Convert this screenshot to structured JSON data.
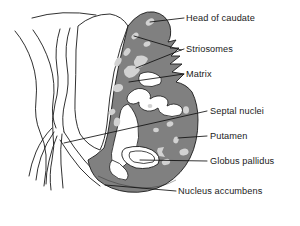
{
  "figure": {
    "kind": "anatomical-line-diagram",
    "canvas": {
      "width": 300,
      "height": 226
    },
    "colors": {
      "background": "#ffffff",
      "outline": "#1a1a1a",
      "striatum_fill": "#808080",
      "striosome_fill": "#d2d2d2",
      "white_matter": "#ffffff",
      "leader_line": "#111111",
      "label_text": "#1a1a1a"
    }
  },
  "labels": [
    {
      "id": "head-of-caudate",
      "text": "Head of caudate",
      "x": 186,
      "y": 14
    },
    {
      "id": "striosomes",
      "text": "Striosomes",
      "x": 186,
      "y": 45
    },
    {
      "id": "matrix",
      "text": "Matrix",
      "x": 186,
      "y": 70
    },
    {
      "id": "septal-nuclei",
      "text": "Septal nuclei",
      "x": 210,
      "y": 107
    },
    {
      "id": "putamen",
      "text": "Putamen",
      "x": 210,
      "y": 132
    },
    {
      "id": "globus-pallidus",
      "text": "Globus pallidus",
      "x": 210,
      "y": 158
    },
    {
      "id": "nucleus-accumbens",
      "text": "Nucleus accumbens",
      "x": 178,
      "y": 187
    }
  ],
  "structures": [
    {
      "id": "caudate-head",
      "name": "Head of caudate"
    },
    {
      "id": "striosomes",
      "name": "Striosomes"
    },
    {
      "id": "matrix",
      "name": "Matrix"
    },
    {
      "id": "septal-nuclei",
      "name": "Septal nuclei"
    },
    {
      "id": "putamen",
      "name": "Putamen"
    },
    {
      "id": "globus-pallidus",
      "name": "Globus pallidus"
    },
    {
      "id": "nucleus-accumbens",
      "name": "Nucleus accumbens"
    },
    {
      "id": "internal-capsule",
      "name": "Internal capsule"
    },
    {
      "id": "cortex-outline",
      "name": "Cortical surface outline"
    }
  ]
}
